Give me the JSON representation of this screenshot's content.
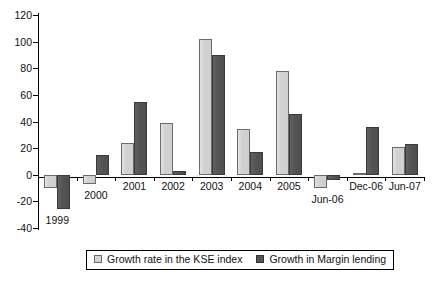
{
  "chart_data": {
    "type": "bar",
    "title": "",
    "subtitle": "",
    "xlabel": "",
    "ylabel": "",
    "ylim": [
      -40,
      120
    ],
    "yticks": [
      -40,
      -20,
      0,
      20,
      40,
      60,
      80,
      100,
      120
    ],
    "ytick_labels": [
      "-40",
      "-20",
      "0",
      "20",
      "40",
      "60",
      "80",
      "100",
      "120"
    ],
    "grid": false,
    "legend_position": "bottom",
    "categories": [
      "1999",
      "2000",
      "2001",
      "2002",
      "2003",
      "2004",
      "2005",
      "Jun-06",
      "Dec-06",
      "Jun-07"
    ],
    "series": [
      {
        "name": "Growth rate in the KSE index",
        "color": "#d2d2d2",
        "values": [
          -10,
          -7,
          24,
          39,
          102,
          34,
          78,
          -10,
          1,
          21
        ]
      },
      {
        "name": "Growth in Margin lending",
        "color": "#545454",
        "values": [
          -26,
          15,
          55,
          3,
          90,
          17,
          46,
          -4,
          36,
          23
        ]
      }
    ]
  },
  "legend": {
    "entries": [
      {
        "label": "Growth rate in the KSE index",
        "swatch": "legend-swatch-kse"
      },
      {
        "label": "Growth in Margin lending",
        "swatch": "legend-swatch-margin"
      }
    ]
  }
}
